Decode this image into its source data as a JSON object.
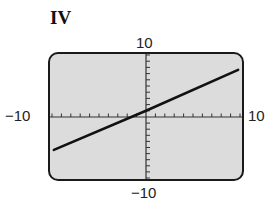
{
  "panel": {
    "label": "IV"
  },
  "window": {
    "xmin_label": "−10",
    "xmax_label": "10",
    "ymin_label": "−10",
    "ymax_label": "10",
    "screen_color": "#dcdcdc",
    "border_color": "#1a1a1a",
    "line_color": "#111111"
  },
  "chart_data": {
    "type": "line",
    "title": "IV",
    "xlabel": "",
    "ylabel": "",
    "xlim": [
      -10,
      10
    ],
    "ylim": [
      -10,
      10
    ],
    "x_tick_step": 1,
    "y_tick_step": 1,
    "grid": false,
    "tick_labels": {
      "x": [
        "-10",
        "10"
      ],
      "y": [
        "-10",
        "10"
      ]
    },
    "series": [
      {
        "name": "line",
        "x": [
          -9.8,
          0,
          9.8
        ],
        "y": [
          -5.4,
          1.0,
          7.6
        ],
        "approx_equation": "y = (2/3)x + 1"
      }
    ]
  }
}
